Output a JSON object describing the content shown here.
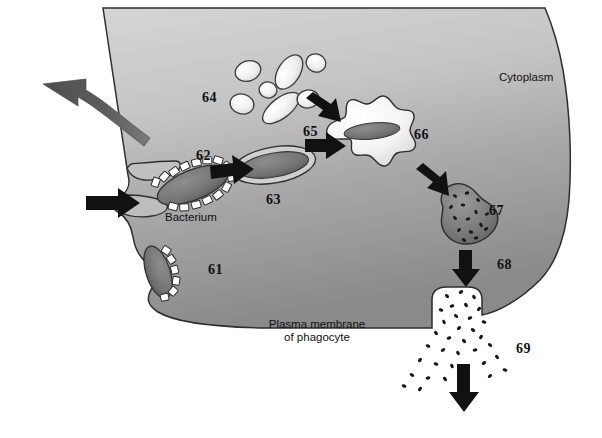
{
  "figure": {
    "width": 602,
    "height": 438,
    "background_color": "#ffffff"
  },
  "colors": {
    "cytoplasm_light": "#c9c9c9",
    "cytoplasm_dark": "#8d8d8d",
    "membrane_outline": "#2b2b2b",
    "arrow_black": "#111111",
    "arrow_gray": "#5a5a5a",
    "vesicle_fill": "#f2f2f2",
    "bacterium_fill": "#6f6f6f",
    "phagolysosome_fill": "#7a7a7a",
    "debris": "#121212",
    "label_text": "#111111"
  },
  "text_labels": [
    {
      "id": "cytoplasm",
      "text": "Cytoplasm",
      "x": 499,
      "y": 71,
      "align": "left"
    },
    {
      "id": "bacterium",
      "text": "Bacterium",
      "x": 165,
      "y": 211,
      "align": "left"
    },
    {
      "id": "plasma-membrane-line1",
      "text": "Plasma membrane",
      "x": 259,
      "y": 318,
      "align": "left"
    },
    {
      "id": "plasma-membrane-line2",
      "text": "of phagocyte",
      "x": 275,
      "y": 331,
      "align": "left"
    }
  ],
  "number_labels": [
    {
      "id": "61",
      "text": "61",
      "x": 208,
      "y": 262
    },
    {
      "id": "62",
      "text": "62",
      "x": 196,
      "y": 148
    },
    {
      "id": "63",
      "text": "63",
      "x": 266,
      "y": 192
    },
    {
      "id": "64",
      "text": "64",
      "x": 202,
      "y": 90
    },
    {
      "id": "65",
      "text": "65",
      "x": 303,
      "y": 124
    },
    {
      "id": "66",
      "text": "66",
      "x": 414,
      "y": 127
    },
    {
      "id": "67",
      "text": "67",
      "x": 489,
      "y": 203
    },
    {
      "id": "68",
      "text": "68",
      "x": 497,
      "y": 257
    },
    {
      "id": "69",
      "text": "69",
      "x": 516,
      "y": 341
    }
  ],
  "structures": [
    {
      "id": "phagocyte-cell-body",
      "name": "phagocyte-cell-body",
      "description": "Large gray cell occupying most of the frame with a gradient from light gray at the top to darker gray at the bottom"
    },
    {
      "id": "pseudopod-upper",
      "name": "pseudopod-upper",
      "description": "Upper pseudopod extension reaching around the bacterium"
    },
    {
      "id": "pseudopod-lower",
      "name": "pseudopod-lower",
      "description": "Lower pseudopod extension reaching around the bacterium"
    },
    {
      "id": "bacterium-engulfed",
      "name": "bacterium-being-engulfed",
      "description": "Rod bacterium outlined with white segmented receptor blocks, held between the pseudopods"
    },
    {
      "id": "bacterium-attached",
      "name": "bacterium-attached-to-membrane",
      "description": "Second rod bacterium attached to the membrane at the lower left with white segmented receptors"
    },
    {
      "id": "phagosome",
      "name": "phagosome",
      "description": "Rod-shaped membrane-bound vesicle containing the bacterium, with a double outline"
    },
    {
      "id": "lysosomes",
      "name": "lysosome-cluster",
      "description": "Cluster of seven pale rounded and rod-shaped lysosome vesicles with dark outlines"
    },
    {
      "id": "phagolysosome-fusing",
      "name": "phagolysosome-fusing",
      "description": "Lumpy amoeboid fusion vesicle with pale fill, containing the dark rod bacterium"
    },
    {
      "id": "phagolysosome-digesting",
      "name": "phagolysosome-digesting",
      "description": "Kidney-shaped dark vesicle speckled with small black dots representing digested material"
    },
    {
      "id": "residual-body",
      "name": "residual-body-exocytosis",
      "description": "Membrane invagination discharging a cone of small dark debris particles out of the cell"
    }
  ],
  "arrows": [
    {
      "id": "arrow-curved-exit",
      "name": "curved-exit-arrow",
      "direction": "left",
      "style": "curved-tapered-gray"
    },
    {
      "id": "arrow-entry",
      "name": "entry-arrow",
      "direction": "right",
      "style": "block-black"
    },
    {
      "id": "arrow-62-63",
      "name": "phagosome-formation-arrow",
      "direction": "right",
      "style": "block-black"
    },
    {
      "id": "arrow-lysosome-upper",
      "name": "lysosome-fusion-arrow-upper",
      "direction": "down-right",
      "style": "block-black"
    },
    {
      "id": "arrow-lysosome-lower",
      "name": "lysosome-fusion-arrow-lower",
      "direction": "right",
      "style": "block-black"
    },
    {
      "id": "arrow-66-67",
      "name": "digestion-arrow",
      "direction": "down-right",
      "style": "block-black"
    },
    {
      "id": "arrow-67-68",
      "name": "residual-body-arrow",
      "direction": "down",
      "style": "block-black"
    },
    {
      "id": "arrow-69-exit",
      "name": "debris-exit-arrow",
      "direction": "down",
      "style": "block-black"
    }
  ]
}
